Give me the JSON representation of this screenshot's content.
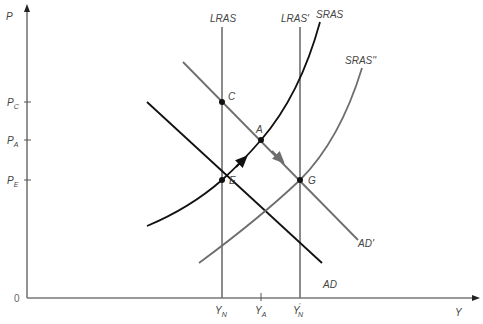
{
  "diagram": {
    "axes": {
      "y_label": "P",
      "x_label": "Y",
      "origin_label": "0",
      "y_ticks": [
        {
          "main": "P",
          "sub": "C",
          "y": 102
        },
        {
          "main": "P",
          "sub": "A",
          "y": 140
        },
        {
          "main": "P",
          "sub": "E",
          "y": 180
        }
      ],
      "x_ticks": [
        {
          "main": "Y",
          "sub": "N",
          "prime": "",
          "x": 222
        },
        {
          "main": "Y",
          "sub": "A",
          "prime": "",
          "x": 261
        },
        {
          "main": "Y",
          "sub": "N",
          "prime": "'",
          "x": 300
        }
      ]
    },
    "curves": {
      "lras": "LRAS",
      "lras_prime": "LRAS'",
      "sras": "SRAS",
      "sras_double_prime": "SRAS''",
      "ad": "AD",
      "ad_prime": "AD'"
    },
    "points": {
      "c": "C",
      "a": "A",
      "e": "E",
      "g": "G"
    },
    "colors": {
      "black_curve": "#111111",
      "gray_curve": "#6e6e6e",
      "axis": "#777777"
    }
  }
}
